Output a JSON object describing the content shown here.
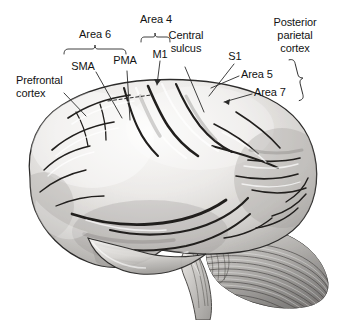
{
  "figure": {
    "background_color": "#ffffff",
    "text_color": "#131313",
    "line_color": "#2a2a2a",
    "illustration": {
      "name": "human-brain-lateral-view",
      "parts": [
        "cerebrum",
        "frontal-lobe",
        "parietal-lobe",
        "temporal-lobe",
        "occipital-lobe",
        "cerebellum",
        "brainstem"
      ],
      "style": "grayscale-airbrush-anatomical-drawing",
      "fill_light": "#f2f1ef",
      "fill_mid": "#c9c8c6",
      "fill_dark": "#8d8c8a",
      "outline": "#2d2c2b"
    }
  },
  "labels": {
    "area6": "Area 6",
    "area4": "Area 4",
    "sma": "SMA",
    "pma": "PMA",
    "m1": "M1",
    "central_sulcus_line1": "Central",
    "central_sulcus_line2": "sulcus",
    "s1": "S1",
    "posterior_parietal_line1": "Posterior",
    "posterior_parietal_line2": "parietal",
    "posterior_parietal_line3": "cortex",
    "area5": "Area 5",
    "area7": "Area 7",
    "prefrontal_line1": "Prefrontal",
    "prefrontal_line2": "cortex"
  },
  "annotations": {
    "brackets": [
      {
        "name": "area-6-bracket",
        "orientation": "horizontal-down",
        "x1": 64,
        "x2": 126,
        "y": 49,
        "tick_x": 95
      },
      {
        "name": "area-4-bracket",
        "orientation": "horizontal-down",
        "x1": 141,
        "x2": 170,
        "y": 37,
        "tick_x": 155
      },
      {
        "name": "posterior-parietal-bracket",
        "orientation": "vertical-left",
        "y1": 58,
        "y2": 99,
        "x": 318,
        "tick_y": 79
      }
    ],
    "leader_lines": [
      {
        "name": "sma-leader",
        "from": [
          95,
          71
        ],
        "to": [
          120,
          115
        ]
      },
      {
        "name": "pma-leader",
        "from": [
          126,
          70
        ],
        "to": [
          130,
          118
        ]
      },
      {
        "name": "m1-leader",
        "from": [
          160,
          60
        ],
        "to": [
          158,
          84
        ]
      },
      {
        "name": "central-sulcus-leader",
        "from": [
          186,
          66
        ],
        "to": [
          203,
          110
        ]
      },
      {
        "name": "s1-leader",
        "from": [
          233,
          63
        ],
        "to": [
          211,
          95
        ]
      },
      {
        "name": "area-5-leader",
        "from": [
          240,
          76
        ],
        "to": [
          212,
          88
        ]
      },
      {
        "name": "area-7-leader",
        "from": [
          253,
          94
        ],
        "to": [
          227,
          102
        ]
      },
      {
        "name": "prefrontal-leader",
        "from": [
          63,
          92
        ],
        "to": [
          85,
          115
        ]
      }
    ],
    "dashed_line": {
      "name": "premotor-boundary-dashed-line",
      "from": [
        108,
        100
      ],
      "to": [
        150,
        95
      ]
    }
  }
}
